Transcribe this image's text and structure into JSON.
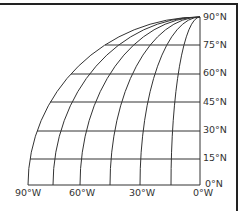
{
  "diagram": {
    "type": "map-graticule",
    "latitude_labels": [
      "90°N",
      "75°N",
      "60°N",
      "45°N",
      "30°N",
      "15°N",
      "0°N"
    ],
    "longitude_labels": [
      "90°W",
      "60°W",
      "30°W",
      "0°W"
    ],
    "latitudes": [
      0,
      15,
      30,
      45,
      60,
      75,
      90
    ],
    "longitudes": [
      0,
      15,
      30,
      45,
      60,
      75,
      90
    ],
    "line_color": "#333333"
  }
}
